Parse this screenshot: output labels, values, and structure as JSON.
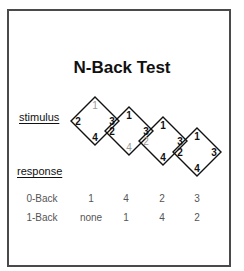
{
  "title": "N-Back Test",
  "labels": {
    "stimulus": "stimulus",
    "response": "response"
  },
  "colors": {
    "frame": "#4a4a4a",
    "ink": "#111111",
    "highlight_gray": "#9a9a9a",
    "row_text": "#555555"
  },
  "stimulus": [
    {
      "top": "1",
      "left": "2",
      "right": "3",
      "bottom": "4",
      "gray": "top"
    },
    {
      "top": "1",
      "left": "2",
      "right": "3",
      "bottom": "4",
      "gray": "bottom"
    },
    {
      "top": "1",
      "left": "2",
      "right": "3",
      "bottom": "4",
      "gray": "left"
    },
    {
      "top": "1",
      "left": "2",
      "right": "3",
      "bottom": "4",
      "gray": "none"
    }
  ],
  "responses": [
    {
      "name": "0-Back",
      "values": [
        "1",
        "4",
        "2",
        "3"
      ]
    },
    {
      "name": "1-Back",
      "values": [
        "none",
        "1",
        "4",
        "2"
      ]
    }
  ]
}
